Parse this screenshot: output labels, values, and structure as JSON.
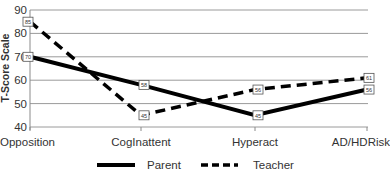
{
  "chart_data": {
    "type": "line",
    "title": "",
    "xlabel": "",
    "ylabel": "T-Score Scale",
    "ylim": [
      40,
      90
    ],
    "yticks": [
      40,
      50,
      60,
      70,
      80,
      90
    ],
    "grid": true,
    "legend_position": "bottom",
    "categories": [
      "Opposition",
      "CogInattent",
      "Hyperact",
      "AD/HDRisk"
    ],
    "series": [
      {
        "name": "Parent",
        "style": "solid",
        "color": "#000000",
        "values": [
          70,
          58,
          45,
          56
        ]
      },
      {
        "name": "Teacher",
        "style": "dashed",
        "color": "#000000",
        "values": [
          85,
          45,
          56,
          61
        ]
      }
    ]
  },
  "colors": {
    "grid": "#9a9a9a",
    "axis": "#8a8a8a",
    "text": "#333333",
    "line": "#000000"
  }
}
